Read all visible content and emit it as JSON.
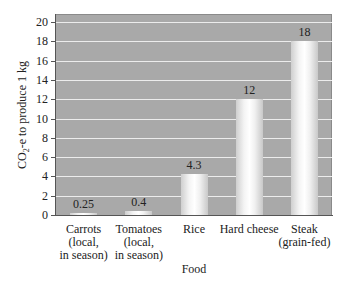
{
  "chart_data": {
    "type": "bar",
    "title": "",
    "xlabel": "Food",
    "ylabel": "CO2-e to produce 1 kg",
    "ylabel_parts": {
      "pre": "CO",
      "sub": "2",
      "post": "-e to produce 1 kg"
    },
    "ylim": [
      0,
      20
    ],
    "yticks": [
      0,
      2,
      4,
      6,
      8,
      10,
      12,
      14,
      16,
      18,
      20
    ],
    "grid": true,
    "legend": null,
    "categories": [
      "Carrots\n(local,\nin season)",
      "Tomatoes\n(local,\nin season)",
      "Rice",
      "Hard cheese",
      "Steak\n(grain-fed)"
    ],
    "values": [
      0.25,
      0.4,
      4.3,
      12,
      18
    ],
    "value_labels": [
      "0.25",
      "0.4",
      "4.3",
      "12",
      "18"
    ],
    "colors": {
      "plot_bg": "#a9a9a9",
      "gridline": "#ececec",
      "bar": "#f4f4f4"
    }
  }
}
